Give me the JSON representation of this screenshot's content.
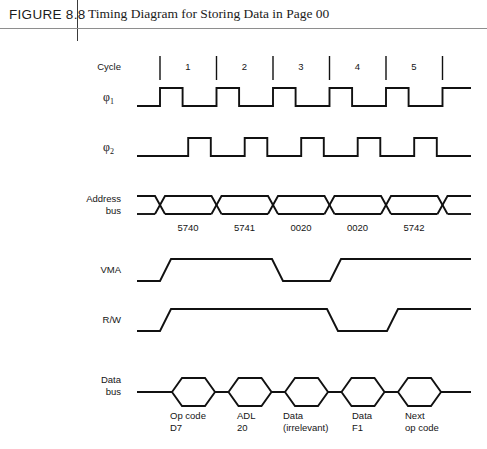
{
  "figure": {
    "number": "FIGURE 8.8",
    "title": "Timing Diagram for Storing Data in Page 00"
  },
  "diagram": {
    "cycle_label": "Cycle",
    "cycles": [
      "1",
      "2",
      "3",
      "4",
      "5"
    ],
    "signals": {
      "phi1": "φ",
      "phi1_sub": "1",
      "phi2": "φ",
      "phi2_sub": "2",
      "address_bus_line1": "Address",
      "address_bus_line2": "bus",
      "vma": "VMA",
      "rw": "R/W",
      "data_bus_line1": "Data",
      "data_bus_line2": "bus"
    },
    "address_values": [
      "5740",
      "5741",
      "0020",
      "0020",
      "5742"
    ],
    "data_items": [
      {
        "line1": "Op code",
        "line2": "D7"
      },
      {
        "line1": "ADL",
        "line2": "20"
      },
      {
        "line1": "Data",
        "line2": "(irrelevant)"
      },
      {
        "line1": "Data",
        "line2": "F1"
      },
      {
        "line1": "Next",
        "line2": "op code"
      }
    ],
    "colors": {
      "ink": "#111111",
      "rule": "#8e8e8e",
      "background": "#ffffff"
    },
    "waveform_meta": {
      "cycle_start_x": 160,
      "cycle_width": 56.5,
      "cycle_count": 5,
      "phi1_duty": 0.4,
      "phi2_duty": 0.4,
      "phi2_offset": 0.5,
      "vma_high_cycles": "0-3 then 4-5",
      "rw_high_cycles": "0-3.6 then 4.4-5"
    }
  }
}
